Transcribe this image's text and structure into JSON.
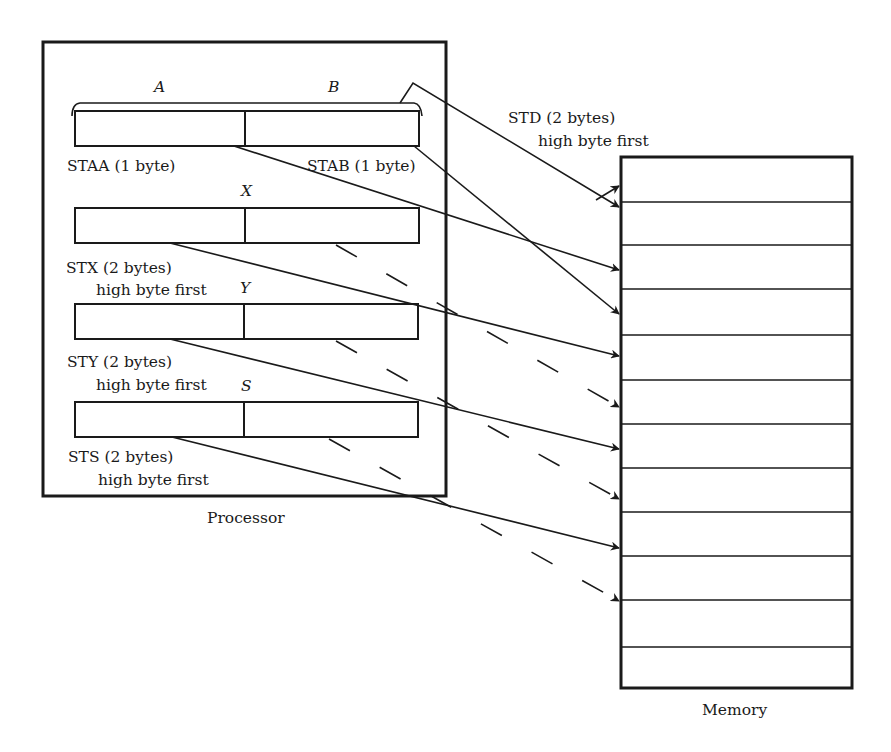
{
  "processor": {
    "caption": "Processor",
    "registers": [
      {
        "name": "A",
        "id": "a"
      },
      {
        "name": "B",
        "id": "b"
      },
      {
        "name": "X",
        "id": "x"
      },
      {
        "name": "Y",
        "id": "y"
      },
      {
        "name": "S",
        "id": "s"
      }
    ]
  },
  "labels": {
    "staa": "STAA (1 byte)",
    "stab": "STAB (1 byte)",
    "std_line1": "STD (2 bytes)",
    "std_line2": "high byte first",
    "stx_line1": "STX (2 bytes)",
    "stx_line2": "high byte first",
    "sty_line1": "STY (2 bytes)",
    "sty_line2": "high byte first",
    "sts_line1": "STS (2 bytes)",
    "sts_line2": "high byte first"
  },
  "memory": {
    "caption": "Memory",
    "cell_count": 12
  },
  "colors": {
    "line": "#1a1a1a",
    "background": "#ffffff"
  }
}
